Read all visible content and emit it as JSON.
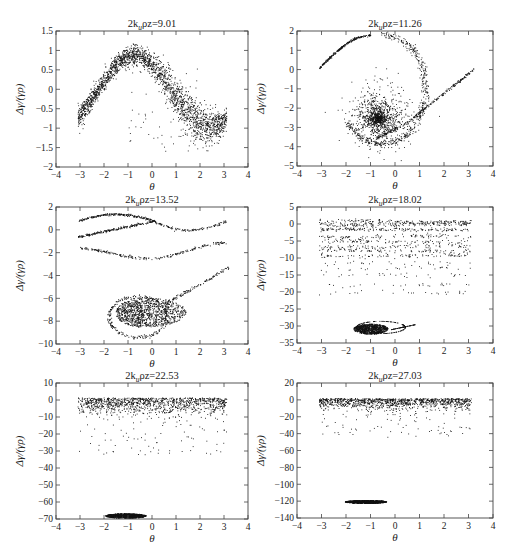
{
  "chart_data": [
    {
      "type": "scatter",
      "title_prefix": "2k",
      "title_sub": "u",
      "title_suffix": "ρz=9.01",
      "title": "2k_u ρz=9.01",
      "xlabel": "θ",
      "ylabel": "Δγ/(γρ)",
      "xlim": [
        -4,
        4
      ],
      "ylim": [
        -2,
        1.5
      ],
      "xticks": [
        -4,
        -3,
        -2,
        -1,
        0,
        1,
        2,
        3,
        4
      ],
      "yticks": [
        -2,
        -1.5,
        -1,
        -0.5,
        0,
        0.5,
        1,
        1.5
      ],
      "ytick_labels": [
        "−2",
        "−1.5",
        "−1",
        "−0.5",
        "0",
        "0.5",
        "1",
        "1.5"
      ],
      "grid": false,
      "series": [
        {
          "name": "electrons",
          "shape": "sine-band",
          "x_range": [
            -3.14,
            3.14
          ],
          "amplitude": 0.9,
          "phase": 0.6,
          "offset": -0.05,
          "spread": 0.22,
          "count": 2200
        }
      ]
    },
    {
      "type": "scatter",
      "title_prefix": "2k",
      "title_sub": "u",
      "title_suffix": "ρz=11.26",
      "title": "2k_u ρz=11.26",
      "xlabel": "θ",
      "ylabel": "Δγ/(γρ)",
      "xlim": [
        -4,
        4
      ],
      "ylim": [
        -5,
        2
      ],
      "xticks": [
        -4,
        -3,
        -2,
        -1,
        0,
        1,
        2,
        3,
        4
      ],
      "yticks": [
        -5,
        -4,
        -3,
        -2,
        -1,
        0,
        1,
        2
      ],
      "ytick_labels": [
        "−5",
        "−4",
        "−3",
        "−2",
        "−1",
        "0",
        "1",
        "2"
      ],
      "grid": false,
      "series": [
        {
          "name": "electrons",
          "shape": "spiral",
          "center": [
            -0.3,
            -2.3
          ],
          "count": 2200
        }
      ]
    },
    {
      "type": "scatter",
      "title_prefix": "2k",
      "title_sub": "u",
      "title_suffix": "ρz=13.52",
      "title": "2k_u ρz=13.52",
      "xlabel": "θ",
      "ylabel": "Δγ/(γρ)",
      "xlim": [
        -4,
        4
      ],
      "ylim": [
        -10,
        2
      ],
      "xticks": [
        -4,
        -3,
        -2,
        -1,
        0,
        1,
        2,
        3,
        4
      ],
      "yticks": [
        -10,
        -8,
        -6,
        -4,
        -2,
        0,
        2
      ],
      "ytick_labels": [
        "−10",
        "−8",
        "−6",
        "−4",
        "−2",
        "0",
        "2"
      ],
      "grid": false,
      "series": [
        {
          "name": "electrons",
          "shape": "bucket-with-strands",
          "bucket_center": [
            -0.5,
            -7.5
          ],
          "count": 2200
        }
      ]
    },
    {
      "type": "scatter",
      "title_prefix": "2k",
      "title_sub": "u",
      "title_suffix": "ρz=18.02",
      "title": "2k_u ρz=18.02",
      "xlabel": "θ",
      "ylabel": "Δγ/(γρ)",
      "xlim": [
        -4,
        4
      ],
      "ylim": [
        -35,
        5
      ],
      "xticks": [
        -4,
        -3,
        -2,
        -1,
        0,
        1,
        2,
        3,
        4
      ],
      "yticks": [
        -35,
        -30,
        -25,
        -20,
        -15,
        -10,
        -5,
        0,
        5
      ],
      "ytick_labels": [
        "−35",
        "−30",
        "−25",
        "−20",
        "−15",
        "−10",
        "−5",
        "0",
        "5"
      ],
      "grid": false,
      "series": [
        {
          "name": "electrons",
          "shape": "stripes-plus-bucket",
          "bucket_center": [
            -1.0,
            -30.5
          ],
          "stripe_range": [
            -21,
            1
          ],
          "count": 2000
        }
      ]
    },
    {
      "type": "scatter",
      "title_prefix": "2k",
      "title_sub": "u",
      "title_suffix": "ρz=22.53",
      "title": "2k_u ρz=22.53",
      "xlabel": "θ",
      "ylabel": "Δγ/(γρ)",
      "xlim": [
        -4,
        4
      ],
      "ylim": [
        -70,
        10
      ],
      "xticks": [
        -4,
        -3,
        -2,
        -1,
        0,
        1,
        2,
        3,
        4
      ],
      "yticks": [
        -70,
        -60,
        -50,
        -40,
        -30,
        -20,
        -10,
        0,
        10
      ],
      "ytick_labels": [
        "−70",
        "−60",
        "−50",
        "−40",
        "−30",
        "−20",
        "−10",
        "0",
        "10"
      ],
      "grid": false,
      "series": [
        {
          "name": "electrons",
          "shape": "band-plus-bucket",
          "bucket_center": [
            -1.1,
            -68
          ],
          "band_range": [
            -12,
            1.5
          ],
          "count": 2000
        }
      ]
    },
    {
      "type": "scatter",
      "title_prefix": "2k",
      "title_sub": "u",
      "title_suffix": "ρz=27.03",
      "title": "2k_u ρz=27.03",
      "xlabel": "θ",
      "ylabel": "Δγ/(γρ)",
      "xlim": [
        -4,
        4
      ],
      "ylim": [
        -140,
        20
      ],
      "xticks": [
        -4,
        -3,
        -2,
        -1,
        0,
        1,
        2,
        3,
        4
      ],
      "yticks": [
        -140,
        -120,
        -100,
        -80,
        -60,
        -40,
        -20,
        0,
        20
      ],
      "ytick_labels": [
        "−140",
        "−120",
        "−100",
        "−80",
        "−60",
        "−40",
        "−20",
        "0",
        "20"
      ],
      "grid": false,
      "series": [
        {
          "name": "electrons",
          "shape": "band-plus-bucket",
          "bucket_center": [
            -1.2,
            -120.5
          ],
          "band_range": [
            -15,
            2
          ],
          "count": 2000
        }
      ]
    }
  ]
}
